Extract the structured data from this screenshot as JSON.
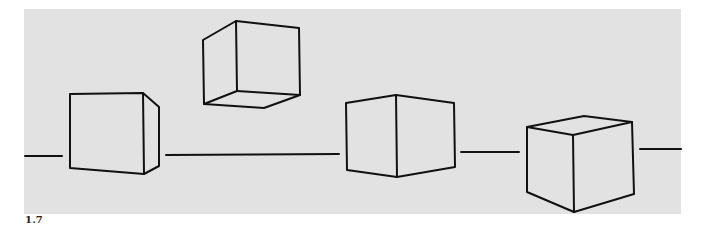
{
  "figure": {
    "label": "1.7",
    "background_color": "#e2e2e2",
    "stroke_color": "#111111",
    "horizon_segments": [
      {
        "x1": 25,
        "y1": 156,
        "x2": 62,
        "y2": 156
      },
      {
        "x1": 166,
        "y1": 155,
        "x2": 339,
        "y2": 154
      },
      {
        "x1": 461,
        "y1": 152,
        "x2": 519,
        "y2": 152
      },
      {
        "x1": 640,
        "y1": 149,
        "x2": 681,
        "y2": 149
      }
    ],
    "cubes": [
      {
        "name": "cube-left-frontal",
        "description": "cube on horizon, front face with right side visible"
      },
      {
        "name": "cube-floating-above",
        "description": "cube above horizon, bottom face visible"
      },
      {
        "name": "cube-center-edge",
        "description": "cube straddling horizon, two faces meeting at vertical edge"
      },
      {
        "name": "cube-right-below",
        "description": "cube below horizon, top face visible"
      }
    ]
  }
}
